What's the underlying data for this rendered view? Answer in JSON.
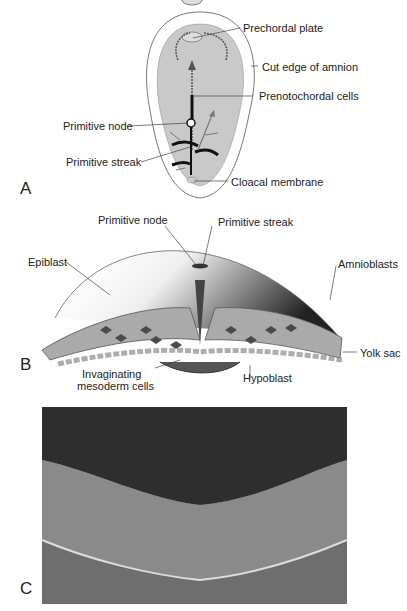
{
  "figure": {
    "panels": [
      {
        "letter": "A",
        "labels": {
          "prechordal_plate": "Prechordal plate",
          "cut_edge_amnion": "Cut edge of amnion",
          "prenotochordal_cells": "Prenotochordal cells",
          "primitive_node": "Primitive node",
          "primitive_streak": "Primitive streak",
          "cloacal_membrane": "Cloacal membrane"
        }
      },
      {
        "letter": "B",
        "labels": {
          "primitive_node": "Primitive node",
          "primitive_streak": "Primitive streak",
          "epiblast": "Epiblast",
          "amnioblasts": "Amnioblasts",
          "yolk_sac": "Yolk sac",
          "invaginating_1": "Invaginating",
          "invaginating_2": "mesoderm cells",
          "hypoblast": "Hypoblast"
        }
      },
      {
        "letter": "C"
      }
    ]
  }
}
